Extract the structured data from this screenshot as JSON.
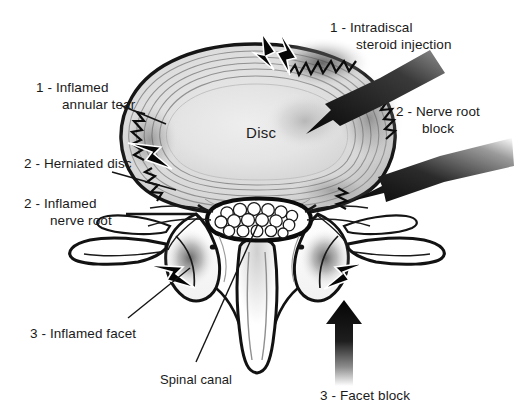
{
  "figure": {
    "background_color": "#ffffff",
    "ink_color": "#1a1a1a",
    "width": 514,
    "height": 415
  },
  "anatomy": {
    "disc_label": "Disc",
    "spinal_canal_label": "Spinal canal",
    "parts": [
      "intervertebral disc",
      "annulus fibrosus rings",
      "nucleus pulposus",
      "spinal canal",
      "cauda equina nerve roots",
      "vertebral lamina",
      "facet joints",
      "transverse processes",
      "spinous process",
      "nerve roots"
    ]
  },
  "annotations": [
    {
      "id": "inflamed-annular-tear",
      "number": "1",
      "line1": "1 - Inflamed",
      "line2": "annular tear",
      "side": "left",
      "marker": "lightning-bolt"
    },
    {
      "id": "herniated-disc",
      "number": "2",
      "line1": "2 - Herniated disc",
      "line2": "",
      "side": "left",
      "marker": "lightning-bolt"
    },
    {
      "id": "inflamed-nerve-root",
      "number": "2",
      "line1": "2 - Inflamed",
      "line2": "nerve root",
      "side": "left",
      "marker": "leader-line"
    },
    {
      "id": "inflamed-facet",
      "number": "3",
      "line1": "3 - Inflamed facet",
      "line2": "",
      "side": "left-bottom",
      "marker": "lightning-bolt"
    },
    {
      "id": "intradiscal-steroid-injection",
      "number": "1",
      "line1": "1 - Intradiscal",
      "line2": "steroid injection",
      "side": "top-right",
      "marker": "black-arrow"
    },
    {
      "id": "nerve-root-block",
      "number": "2",
      "line1": "2 - Nerve root",
      "line2": "block",
      "side": "right",
      "marker": "black-arrow"
    },
    {
      "id": "facet-block",
      "number": "3",
      "line1": "3 - Facet block",
      "line2": "",
      "side": "bottom-right",
      "marker": "black-arrow"
    },
    {
      "id": "spinal-canal",
      "number": "",
      "line1": "Spinal canal",
      "line2": "",
      "side": "bottom",
      "marker": "leader-line"
    }
  ],
  "legend_numbers": {
    "one": "1",
    "two": "2",
    "three": "3"
  }
}
